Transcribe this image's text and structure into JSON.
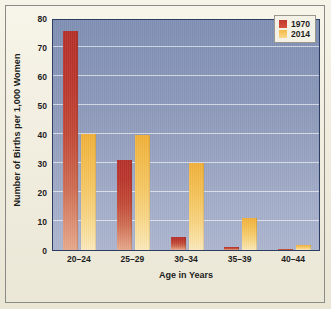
{
  "chart_data": {
    "type": "bar",
    "title": "",
    "xlabel": "Age in Years",
    "ylabel": "Number of Births per 1,000 Women",
    "categories": [
      "20–24",
      "25–29",
      "30–34",
      "35–39",
      "40–44"
    ],
    "series": [
      {
        "name": "1970",
        "color": "#bb372d",
        "values": [
          75.5,
          31,
          4.5,
          1.2,
          0.4
        ]
      },
      {
        "name": "2014",
        "color": "#f3bb45",
        "values": [
          40,
          39.8,
          30,
          11,
          1.6
        ]
      }
    ],
    "ylim": [
      0,
      80
    ],
    "yticks": [
      0,
      10,
      20,
      30,
      40,
      50,
      60,
      70,
      80
    ],
    "ytick_labels": [
      "0",
      "10",
      "20",
      "30",
      "40",
      "50",
      "60",
      "70",
      "80"
    ],
    "grid": true,
    "legend_position": "top-right",
    "legend_entries": [
      "1970",
      "2014"
    ],
    "plot_background_top_color": "#7f90b4",
    "plot_background_bottom_color": "#adb5cf",
    "gridline_color": "#ffffff",
    "page_background_color": "#f2efe2",
    "axis_border_color": "#2c3c63"
  }
}
